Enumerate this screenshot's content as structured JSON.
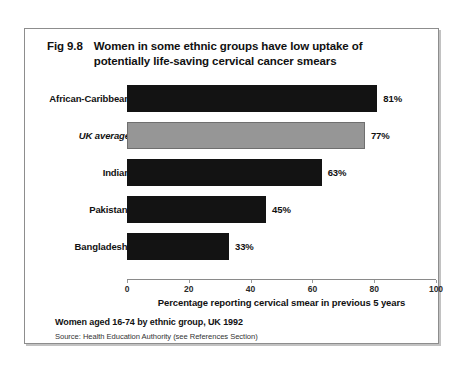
{
  "figure": {
    "number": "Fig 9.8",
    "title_line1": "Women in some ethnic groups have low uptake of",
    "title_line2": "potentially life-saving cervical cancer smears",
    "footer_note": "Women aged 16-74 by ethnic group, UK 1992",
    "footer_source": "Source: Health Education Authority (see References Section)"
  },
  "colors": {
    "bar_dark": "#131313",
    "bar_highlight": "#969696",
    "frame": "#8d8d8d",
    "axis": "#8a8a8a",
    "text": "#111111",
    "background": "#ffffff"
  },
  "chart_data": {
    "type": "bar",
    "orientation": "horizontal",
    "title": "Fig 9.8  Women in some ethnic groups have low uptake of potentially life-saving cervical cancer smears",
    "subtitle": "Women aged 16-74 by ethnic group, UK 1992",
    "source": "Source: Health Education Authority (see References Section)",
    "categories": [
      "African-Caribbean",
      "UK average",
      "Indian",
      "Pakistani",
      "Bangladeshi"
    ],
    "values": [
      81,
      77,
      63,
      45,
      33
    ],
    "value_labels": [
      "81%",
      "77%",
      "63%",
      "45%",
      "33%"
    ],
    "bar_styles": [
      "dark",
      "grey",
      "dark",
      "dark",
      "dark"
    ],
    "emphasis_category": "UK average",
    "xlabel": "Percentage reporting cervical smear in previous 5 years",
    "ylabel": "",
    "xlim": [
      0,
      100
    ],
    "xticks": [
      0,
      20,
      40,
      60,
      80,
      100
    ],
    "xtick_labels": [
      "0",
      "20",
      "40",
      "60",
      "80",
      "100"
    ],
    "grid": false,
    "legend": "none"
  }
}
